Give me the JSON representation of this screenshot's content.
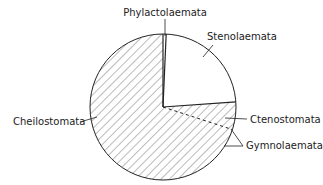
{
  "chart_data": {
    "type": "pie",
    "title": "",
    "xlabel": "",
    "ylabel": "",
    "legend": "none (direct labels with leader lines)",
    "grid": false,
    "start_angle_deg": 0,
    "direction": "clockwise",
    "categories": [
      "Phylactolaemata",
      "Stenolaemata",
      "Ctenostomata",
      "Cheilostomata"
    ],
    "values": [
      0.7,
      23.1,
      6.1,
      70.1
    ],
    "units": "percent (estimated from slice angles)",
    "slices": [
      {
        "label": "Phylactolaemata",
        "start_deg": 0,
        "end_deg": 2.5,
        "fill": "white",
        "hatched": false
      },
      {
        "label": "Stenolaemata",
        "start_deg": 2.5,
        "end_deg": 86,
        "fill": "white",
        "hatched": false
      },
      {
        "label": "Ctenostomata",
        "start_deg": 86,
        "end_deg": 108,
        "fill": "hatched",
        "hatched": true
      },
      {
        "label": "Cheilostomata",
        "start_deg": 108,
        "end_deg": 360,
        "fill": "hatched",
        "hatched": true
      }
    ],
    "group_annotations": [
      {
        "label": "Gymnolaemata",
        "members": [
          "Ctenostomata",
          "Cheilostomata"
        ],
        "value": 76.2
      }
    ],
    "separator_styles": {
      "Ctenostomata|Cheilostomata": "dashed"
    }
  },
  "labels": {
    "phylactolaemata": "Phylactolaemata",
    "stenolaemata": "Stenolaemata",
    "ctenostomata": "Ctenostomata",
    "gymnolaemata": "Gymnolaemata",
    "cheilostomata": "Cheilostomata"
  },
  "colors": {
    "line": "#222222",
    "hatch": "#555555",
    "background": "#ffffff"
  }
}
